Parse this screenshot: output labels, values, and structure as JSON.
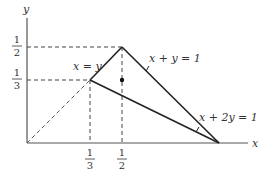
{
  "diagram": {
    "axes": {
      "x_label": "x",
      "y_label": "y"
    },
    "y_ticks": [
      {
        "num": "1",
        "den": "2"
      },
      {
        "num": "1",
        "den": "3"
      }
    ],
    "x_ticks": [
      {
        "num": "1",
        "den": "3"
      },
      {
        "num": "1",
        "den": "2"
      }
    ],
    "line_labels": {
      "x_eq_y": "x = y",
      "x_plus_y": "x + y = 1",
      "x_plus_2y": "x + 2y = 1"
    },
    "points": [
      {
        "name": "origin",
        "x": 0,
        "y": 0
      },
      {
        "name": "A",
        "x": 0.3333,
        "y": 0.3333
      },
      {
        "name": "B",
        "x": 0.5,
        "y": 0.5
      },
      {
        "name": "C",
        "x": 1,
        "y": 0
      },
      {
        "name": "dot",
        "x": 0.5,
        "y": 0.3333
      }
    ],
    "colors": {
      "line": "#222222",
      "dashed": "#444444"
    }
  }
}
